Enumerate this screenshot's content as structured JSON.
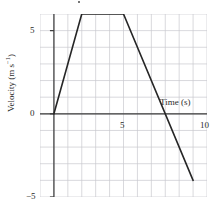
{
  "chart_data": {
    "type": "line",
    "title": "",
    "xlabel": "Time (s)",
    "ylabel_text": "Velocity (m s",
    "ylabel_sup": "−1",
    "ylabel_tail": ")",
    "xlim": [
      -1,
      11
    ],
    "ylim": [
      -5,
      6
    ],
    "grid": true,
    "grid_step_x": 1,
    "grid_step_y": 1,
    "x_ticks": [
      5,
      10
    ],
    "x_tick_labels": [
      "5",
      "10"
    ],
    "y_ticks": [
      5,
      0,
      -5
    ],
    "y_tick_labels": [
      "5",
      "0",
      "−5"
    ],
    "legend": "none",
    "series": [
      {
        "name": "velocity",
        "color": "#262626",
        "x": [
          0,
          2,
          5,
          10
        ],
        "y": [
          0,
          6,
          6,
          -4
        ],
        "annotations": [
          "zero-crossing at t = 8 s"
        ]
      }
    ]
  },
  "axes": {
    "x_title": "Time (s)",
    "y_title_main": "Velocity (m s",
    "y_title_sup": "−1",
    "y_title_end": ")",
    "tick_5": "5",
    "tick_10": "10",
    "tick_y5": "5",
    "tick_y0": "0",
    "tick_ym5": "−5"
  },
  "colors": {
    "grid": "#c9c9cf",
    "axis": "#3a3a3a",
    "data": "#262626",
    "background": "#ffffff"
  }
}
